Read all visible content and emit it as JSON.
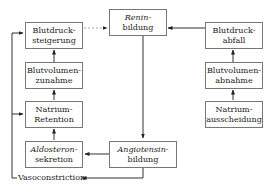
{
  "diagram": {
    "type": "flowchart",
    "nodes": {
      "renin": {
        "line1": "Renin-",
        "line2": "bildung",
        "italic": true
      },
      "bp_increase": {
        "line1": "Blutdruck-",
        "line2": "steigerung"
      },
      "bv_increase": {
        "line1": "Blutvolumen-",
        "line2": "zunahme"
      },
      "na_retention": {
        "line1": "Natrium-",
        "line2": "Retention"
      },
      "aldosterone": {
        "line1": "Aldosteron-",
        "line2": "sekretion",
        "italic": true
      },
      "angiotensin": {
        "line1": "Angiotensin-",
        "line2": "bildung",
        "italic": true
      },
      "bp_drop": {
        "line1": "Blutdruck-",
        "line2": "abfall"
      },
      "bv_decrease": {
        "line1": "Blutvolumen-",
        "line2": "abnahme"
      },
      "na_excretion": {
        "line1": "Natrium-",
        "line2": "ausscheidung"
      }
    },
    "vasoconstriction_label": "Vasoconstriction",
    "edges": [
      {
        "from": "bp_increase",
        "to": "renin",
        "style": "dotted"
      },
      {
        "from": "bp_drop",
        "to": "renin",
        "style": "solid"
      },
      {
        "from": "renin",
        "to": "angiotensin",
        "style": "solid"
      },
      {
        "from": "angiotensin",
        "to": "aldosterone",
        "style": "solid"
      },
      {
        "from": "angiotensin",
        "to": "vasoconstriction",
        "style": "solid"
      },
      {
        "from": "aldosterone",
        "to": "na_retention",
        "style": "solid"
      },
      {
        "from": "na_retention",
        "to": "bv_increase",
        "style": "solid"
      },
      {
        "from": "bv_increase",
        "to": "bp_increase",
        "style": "solid"
      },
      {
        "from": "vasoconstriction",
        "to": "bp_increase",
        "style": "solid"
      },
      {
        "from": "vasoconstriction",
        "to": "na_retention",
        "style": "solid"
      },
      {
        "from": "na_excretion",
        "to": "bv_decrease",
        "style": "solid"
      },
      {
        "from": "bv_decrease",
        "to": "bp_drop",
        "style": "solid"
      }
    ],
    "colors": {
      "line": "#333333",
      "border": "#777777",
      "dotted": "#aaaaaa"
    }
  }
}
